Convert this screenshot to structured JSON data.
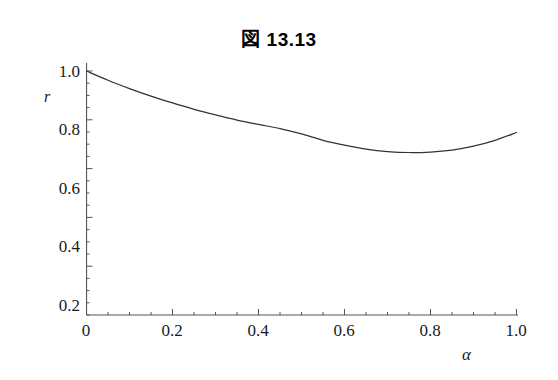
{
  "figure": {
    "title": "図 13.13",
    "background_color": "#ffffff",
    "axis_color": "#555555",
    "curve_color": "#333333",
    "text_color": "#1a1a1a"
  },
  "chart_data": {
    "type": "line",
    "title": "図 13.13",
    "xlabel": "α",
    "ylabel": "r",
    "xlim": [
      0,
      1.0
    ],
    "ylim": [
      0,
      1.0
    ],
    "grid": false,
    "legend": null,
    "xticks": [
      "0",
      "0.2",
      "0.4",
      "0.6",
      "0.8",
      "1.0"
    ],
    "xtick_values": [
      0,
      0.2,
      0.4,
      0.6,
      0.8,
      1.0
    ],
    "yticks": [
      "0.2",
      "0.4",
      "0.6",
      "0.8",
      "1.0"
    ],
    "ytick_values": [
      0.2,
      0.4,
      0.6,
      0.8,
      1.0
    ],
    "minor_tick_interval_x": 0.05,
    "minor_tick_interval_y": 0.05,
    "series": [
      {
        "name": "r(α)",
        "x": [
          0.0,
          0.05,
          0.1,
          0.15,
          0.2,
          0.25,
          0.3,
          0.35,
          0.4,
          0.45,
          0.5,
          0.55,
          0.6,
          0.65,
          0.7,
          0.75,
          0.8,
          0.85,
          0.9,
          0.95,
          1.0
        ],
        "values": [
          1.0,
          0.962,
          0.928,
          0.897,
          0.869,
          0.843,
          0.82,
          0.799,
          0.781,
          0.764,
          0.742,
          0.716,
          0.696,
          0.68,
          0.67,
          0.666,
          0.668,
          0.676,
          0.692,
          0.716,
          0.748
        ]
      }
    ],
    "annotations": {
      "minimum_x": 0.67,
      "minimum_y": 0.665,
      "start_y": 1.0,
      "end_y": 0.748
    }
  },
  "axis_titles": {
    "y": "r",
    "x": "α"
  }
}
